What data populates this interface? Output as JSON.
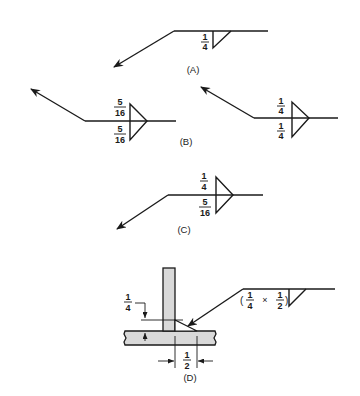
{
  "diagram": {
    "colors": {
      "ink": "#1a1a1a",
      "plate_fill": "#d9d9d9",
      "background": "#ffffff"
    },
    "panels": {
      "A": {
        "label": "(A)",
        "weld": "fillet, other side",
        "size": {
          "num": "1",
          "den": "4"
        }
      },
      "B": {
        "label": "(B)",
        "left": {
          "weld": "fillet, both sides",
          "arrow_side": {
            "num": "5",
            "den": "16"
          },
          "other_side": {
            "num": "5",
            "den": "16"
          }
        },
        "right": {
          "weld": "fillet, both sides",
          "arrow_side": {
            "num": "1",
            "den": "4"
          },
          "other_side": {
            "num": "1",
            "den": "4"
          }
        }
      },
      "C": {
        "label": "(C)",
        "weld": "fillet, both sides",
        "top": {
          "num": "1",
          "den": "4"
        },
        "bottom": {
          "num": "5",
          "den": "16"
        }
      },
      "D": {
        "label": "(D)",
        "weld": "unequal-leg fillet on T-joint",
        "symbol_text": {
          "open": "(",
          "leg1": {
            "num": "1",
            "den": "4"
          },
          "times": "×",
          "leg2": {
            "num": "1",
            "den": "2"
          },
          "close": ")"
        },
        "dim_vertical": {
          "num": "1",
          "den": "4"
        },
        "dim_horizontal": {
          "num": "1",
          "den": "2"
        }
      }
    }
  }
}
